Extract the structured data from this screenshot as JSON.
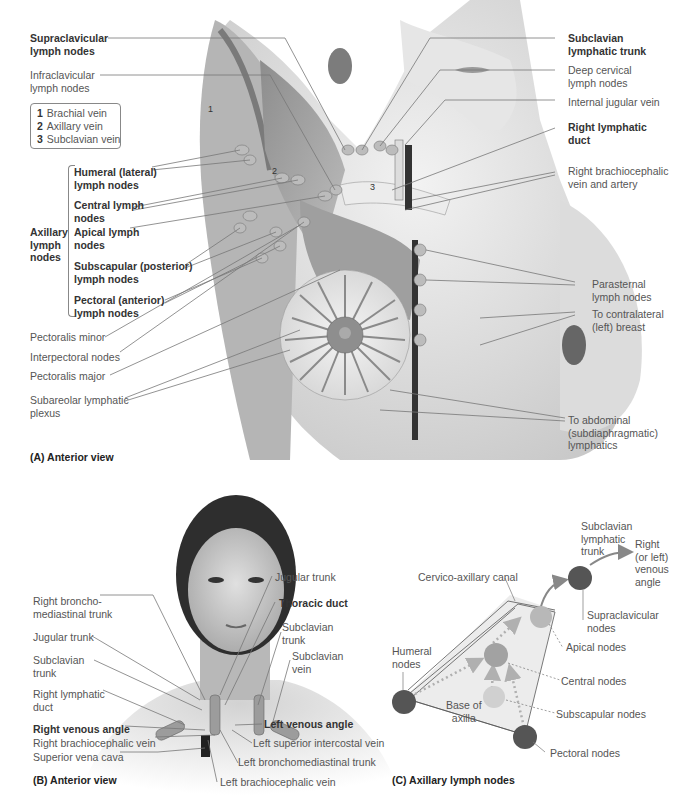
{
  "panel_a": {
    "caption": "(A) Anterior view",
    "legend": [
      {
        "num": "1",
        "label": "Brachial vein"
      },
      {
        "num": "2",
        "label": "Axillary vein"
      },
      {
        "num": "3",
        "label": "Subclavian vein"
      }
    ],
    "figure_numbers": [
      "1",
      "2",
      "3"
    ],
    "group_label": [
      "Axillary",
      "lymph",
      "nodes"
    ],
    "left_labels": [
      {
        "lines": [
          "Supraclavicular",
          "lymph nodes"
        ],
        "bold": true
      },
      {
        "lines": [
          "Infraclavicular",
          "lymph nodes"
        ],
        "bold": false
      },
      {
        "lines": [
          "Humeral (lateral)",
          "lymph nodes"
        ],
        "bold": true
      },
      {
        "lines": [
          "Central lymph",
          "nodes"
        ],
        "bold": true
      },
      {
        "lines": [
          "Apical lymph",
          "nodes"
        ],
        "bold": true
      },
      {
        "lines": [
          "Subscapular (posterior)",
          "lymph nodes"
        ],
        "bold": true
      },
      {
        "lines": [
          "Pectoral (anterior)",
          "lymph nodes"
        ],
        "bold": true
      },
      {
        "lines": [
          "Pectoralis minor"
        ],
        "bold": false
      },
      {
        "lines": [
          "Interpectoral nodes"
        ],
        "bold": false
      },
      {
        "lines": [
          "Pectoralis major"
        ],
        "bold": false
      },
      {
        "lines": [
          "Subareolar lymphatic",
          "plexus"
        ],
        "bold": false
      }
    ],
    "right_labels": [
      {
        "lines": [
          "Subclavian",
          "lymphatic trunk"
        ],
        "bold": true
      },
      {
        "lines": [
          "Deep cervical",
          "lymph nodes"
        ],
        "bold": false
      },
      {
        "lines": [
          "Internal jugular vein"
        ],
        "bold": false
      },
      {
        "lines": [
          "Right lymphatic",
          "duct"
        ],
        "bold": true
      },
      {
        "lines": [
          "Right brachiocephalic",
          "vein and artery"
        ],
        "bold": false
      },
      {
        "lines": [
          "Parasternal",
          "lymph nodes"
        ],
        "bold": false
      },
      {
        "lines": [
          "To contralateral",
          "(left) breast"
        ],
        "bold": false
      },
      {
        "lines": [
          "To abdominal",
          "(subdiaphragmatic)",
          "lymphatics"
        ],
        "bold": false
      }
    ]
  },
  "panel_b": {
    "caption": "(B) Anterior view",
    "left_labels": [
      {
        "lines": [
          "Right broncho-",
          "mediastinal trunk"
        ],
        "bold": false
      },
      {
        "lines": [
          "Jugular trunk"
        ],
        "bold": false
      },
      {
        "lines": [
          "Subclavian",
          "trunk"
        ],
        "bold": false
      },
      {
        "lines": [
          "Right lymphatic",
          "duct"
        ],
        "bold": false
      },
      {
        "lines": [
          "Right venous angle"
        ],
        "bold": true
      },
      {
        "lines": [
          "Right brachiocephalic vein"
        ],
        "bold": false
      },
      {
        "lines": [
          "Superior vena cava"
        ],
        "bold": false
      }
    ],
    "right_labels": [
      {
        "lines": [
          "Jugular trunk"
        ],
        "bold": false
      },
      {
        "lines": [
          "Thoracic duct"
        ],
        "bold": true
      },
      {
        "lines": [
          "Subclavian",
          "trunk"
        ],
        "bold": false
      },
      {
        "lines": [
          "Subclavian",
          "vein"
        ],
        "bold": false
      },
      {
        "lines": [
          "Left venous angle"
        ],
        "bold": true
      },
      {
        "lines": [
          "Left superior intercostal vein"
        ],
        "bold": false
      },
      {
        "lines": [
          "Left bronchomediastinal trunk"
        ],
        "bold": false
      },
      {
        "lines": [
          "Left brachiocephalic vein"
        ],
        "bold": false
      }
    ]
  },
  "panel_c": {
    "caption": "(C) Axillary lymph nodes",
    "labels": {
      "subclavian_trunk": [
        "Subclavian",
        "lymphatic",
        "trunk"
      ],
      "venous_angle": [
        "Right",
        "(or left)",
        "venous",
        "angle"
      ],
      "canal": [
        "Cervico-axillary canal"
      ],
      "supraclavicular": [
        "Supraclavicular",
        "nodes"
      ],
      "apical": [
        "Apical nodes"
      ],
      "humeral": [
        "Humeral",
        "nodes"
      ],
      "central": [
        "Central nodes"
      ],
      "base": [
        "Base of",
        "axilla"
      ],
      "subscapular": [
        "Subscapular nodes"
      ],
      "pectoral": [
        "Pectoral nodes"
      ]
    },
    "colors": {
      "dark_node": "#555555",
      "mid_node": "#9a9a9a",
      "light_node": "#c4c4c4",
      "flow_arrow": "#b0b0b0"
    }
  }
}
